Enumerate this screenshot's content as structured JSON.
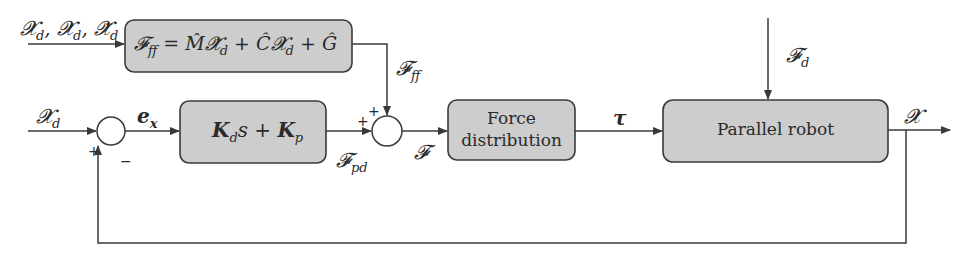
{
  "diagram": {
    "type": "control block diagram",
    "blocks": {
      "feedforward": {
        "lhs": "𝓕",
        "lhs_sub": "ff",
        "rhs": "= M̂𝓧̈",
        "rhs_sub1": "d",
        "rhs2": " + Ĉ𝓧̇",
        "rhs_sub2": "d",
        "rhs3": " + Ĝ"
      },
      "pd": {
        "k1": "K",
        "k1_sub": "d",
        "mid": "s + ",
        "k2": "K",
        "k2_sub": "p"
      },
      "force_distribution": {
        "line1": "Force",
        "line2": "distribution"
      },
      "robot": {
        "label": "Parallel robot"
      }
    },
    "signals": {
      "ff_inputs": {
        "a": "𝓧",
        "a_sub": "d",
        "b": "𝓧̇",
        "b_sub": "d",
        "c": "𝓧̈",
        "c_sub": "d"
      },
      "ref_input": {
        "sym": "𝓧",
        "sub": "d"
      },
      "error": {
        "sym": "e",
        "sub": "x"
      },
      "f_ff": {
        "sym": "𝓕",
        "sub": "ff"
      },
      "f_pd": {
        "sym": "𝓕",
        "sub": "pd"
      },
      "f_total": {
        "sym": "𝓕"
      },
      "tau": {
        "sym": "τ"
      },
      "disturbance": {
        "sym": "𝓕",
        "sub": "d"
      },
      "output": {
        "sym": "𝓧"
      }
    },
    "signs": {
      "j1_plus": "+",
      "j1_minus": "−",
      "j2_plus_top": "+",
      "j2_plus_left": "+"
    },
    "colors": {
      "block_fill": "#cdcdcd",
      "line": "#3a3a3a"
    }
  }
}
